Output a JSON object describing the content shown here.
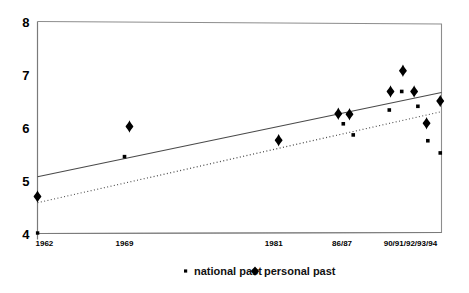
{
  "chart_data": {
    "type": "scatter",
    "title": "",
    "subtitle": "",
    "xlabel": "",
    "ylabel": "",
    "grid": false,
    "legend_position": "bottom-center",
    "ylim": [
      4,
      8
    ],
    "y_ticks": [
      "4",
      "5",
      "6",
      "7",
      "8"
    ],
    "y_tick_values": [
      4,
      5,
      6,
      7,
      8
    ],
    "x_ticks": [
      "1962",
      "1969",
      "1981",
      "86/87",
      "90/91/92/93/94"
    ],
    "x_tick_positions": [
      1962,
      1969,
      1981,
      1986.5,
      1992
    ],
    "xlim": [
      1962,
      1994.5
    ],
    "legend": [
      {
        "label": "national past",
        "marker": "square",
        "color": "#000000"
      },
      {
        "label": "personal past",
        "marker": "diamond",
        "color": "#000000"
      }
    ],
    "series": [
      {
        "name": "national past",
        "marker": "square",
        "points": [
          {
            "x": 1969.0,
            "y": 5.45
          },
          {
            "x": 1986.6,
            "y": 6.07
          },
          {
            "x": 1987.4,
            "y": 5.86
          },
          {
            "x": 1990.3,
            "y": 6.33
          },
          {
            "x": 1991.3,
            "y": 6.68
          },
          {
            "x": 1992.6,
            "y": 6.4
          },
          {
            "x": 1993.4,
            "y": 5.75
          },
          {
            "x": 1994.4,
            "y": 5.52
          }
        ]
      },
      {
        "name": "personal past",
        "marker": "diamond",
        "points": [
          {
            "x": 1962.0,
            "y": 4.7
          },
          {
            "x": 1969.4,
            "y": 6.02
          },
          {
            "x": 1981.4,
            "y": 5.76
          },
          {
            "x": 1986.2,
            "y": 6.26
          },
          {
            "x": 1987.1,
            "y": 6.25
          },
          {
            "x": 1990.4,
            "y": 6.68
          },
          {
            "x": 1991.4,
            "y": 7.07
          },
          {
            "x": 1992.3,
            "y": 6.68
          },
          {
            "x": 1993.3,
            "y": 6.08
          },
          {
            "x": 1994.4,
            "y": 6.5
          }
        ]
      }
    ],
    "trend_lines": [
      {
        "name": "personal past trend",
        "style": "solid",
        "x_start": 1962,
        "y_start": 5.07,
        "x_end": 1994.5,
        "y_end": 6.66
      },
      {
        "name": "national past trend",
        "style": "dotted",
        "x_start": 1962,
        "y_start": 4.58,
        "x_end": 1994.5,
        "y_end": 6.3
      }
    ]
  }
}
